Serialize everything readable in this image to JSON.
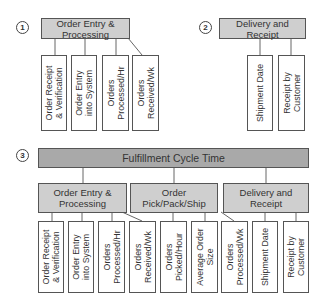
{
  "section1": {
    "number": "1",
    "header": "Order Entry &\nProcessing",
    "leaves": [
      "Order Receipt\n& Verification",
      "Order Entry\ninto System",
      "Orders\nProcessed/Hr",
      "Orders\nReceived/Wk"
    ]
  },
  "section2": {
    "number": "2",
    "header": "Delivery and\nReceipt",
    "leaves": [
      "Shipment Date",
      "Receipt by\nCustomer"
    ]
  },
  "section3": {
    "number": "3",
    "top": "Fulfillment Cycle Time",
    "groups": [
      {
        "header": "Order Entry &\nProcessing"
      },
      {
        "header": "Order\nPick/Pack/Ship"
      },
      {
        "header": "Delivery and\nReceipt"
      }
    ],
    "leaves": [
      "Order Receipt\n& Verification",
      "Order Entry\ninto System",
      "Orders\nProcessed/Hr",
      "Orders\nReceived/Wk",
      "Orders\nPicked/Hour",
      "Average Order\nSize",
      "Orders\nProcessed/Wk",
      "Shipment Date",
      "Receipt by\nCustomer"
    ]
  },
  "colors": {
    "header_fill": "#cfcfcf",
    "top_fill": "#a9a9a9",
    "border": "#555555"
  }
}
